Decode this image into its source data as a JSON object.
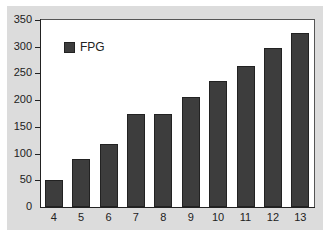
{
  "chart_data": {
    "type": "bar",
    "title": "",
    "xlabel": "",
    "ylabel": "",
    "categories": [
      "4",
      "5",
      "6",
      "7",
      "8",
      "9",
      "10",
      "11",
      "12",
      "13"
    ],
    "series": [
      {
        "name": "FPG",
        "values": [
          50,
          90,
          118,
          175,
          175,
          205,
          235,
          263,
          297,
          325
        ],
        "color": "#3d3d3d"
      }
    ],
    "ylim": [
      0,
      350
    ],
    "yticks": [
      0,
      50,
      100,
      150,
      200,
      250,
      300,
      350
    ],
    "grid": false,
    "legend_position": "upper-left-inside",
    "background": "#dcdcdc",
    "plot_background": "#ffffff"
  },
  "legend": {
    "label": "FPG"
  },
  "yticks_text": [
    "0",
    "50",
    "100",
    "150",
    "200",
    "250",
    "300",
    "350"
  ]
}
